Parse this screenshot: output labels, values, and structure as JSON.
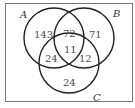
{
  "diagram": {
    "type": "venn-3",
    "colors": {
      "stroke": "#222222",
      "frame": "#777777",
      "text": "#4a4a4a",
      "background": "#ffffff"
    },
    "sets": [
      {
        "id": "A",
        "label": "A"
      },
      {
        "id": "B",
        "label": "B"
      },
      {
        "id": "C",
        "label": "C"
      }
    ],
    "regions": {
      "A_only": "143",
      "B_only": "71",
      "C_only": "24",
      "A_and_B_only": "72",
      "A_and_C_only": "24",
      "B_and_C_only": "12",
      "A_and_B_and_C": "11"
    }
  }
}
